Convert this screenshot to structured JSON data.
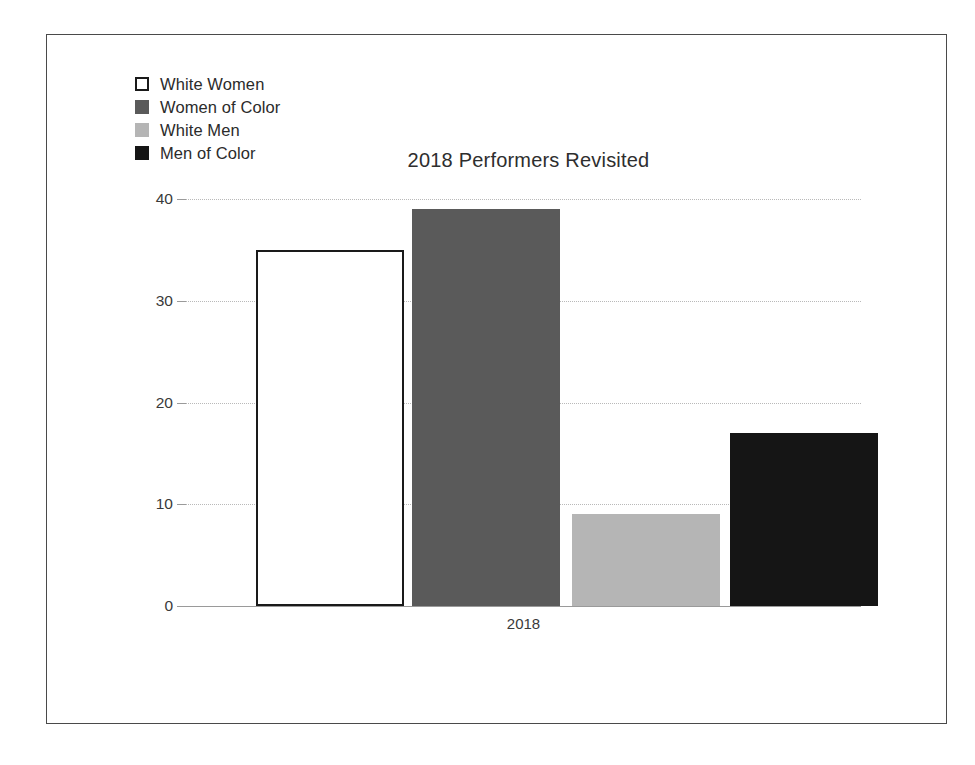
{
  "chart_data": {
    "type": "bar",
    "title": "2018 Performers Revisited",
    "xlabel": "",
    "ylabel": "",
    "categories": [
      "2018"
    ],
    "series": [
      {
        "name": "White Women",
        "values": [
          35
        ],
        "color": "#ffffff",
        "border": "#1a1a1a"
      },
      {
        "name": "Women of Color",
        "values": [
          39
        ],
        "color": "#5a5a5a",
        "border": "#5a5a5a"
      },
      {
        "name": "White Men",
        "values": [
          9
        ],
        "color": "#b5b5b5",
        "border": "#b5b5b5"
      },
      {
        "name": "Men of Color",
        "values": [
          17
        ],
        "color": "#151515",
        "border": "#151515"
      }
    ],
    "ylim": [
      0,
      40
    ],
    "yticks": [
      0,
      10,
      20,
      30,
      40
    ],
    "ytick_labels": [
      "0",
      "10",
      "20",
      "30",
      "40"
    ],
    "grid": true,
    "grid_style": "dotted",
    "grid_axis": "y",
    "legend": {
      "position": "top-left",
      "entries": [
        {
          "label": "White Women",
          "swatch": "white-outlined-square"
        },
        {
          "label": "Women of Color",
          "swatch": "medium-gray-square"
        },
        {
          "label": "White Men",
          "swatch": "light-gray-square"
        },
        {
          "label": "Men of Color",
          "swatch": "black-square"
        }
      ]
    }
  },
  "frame": {
    "border_color": "#4a4a4a",
    "background": "#ffffff"
  }
}
